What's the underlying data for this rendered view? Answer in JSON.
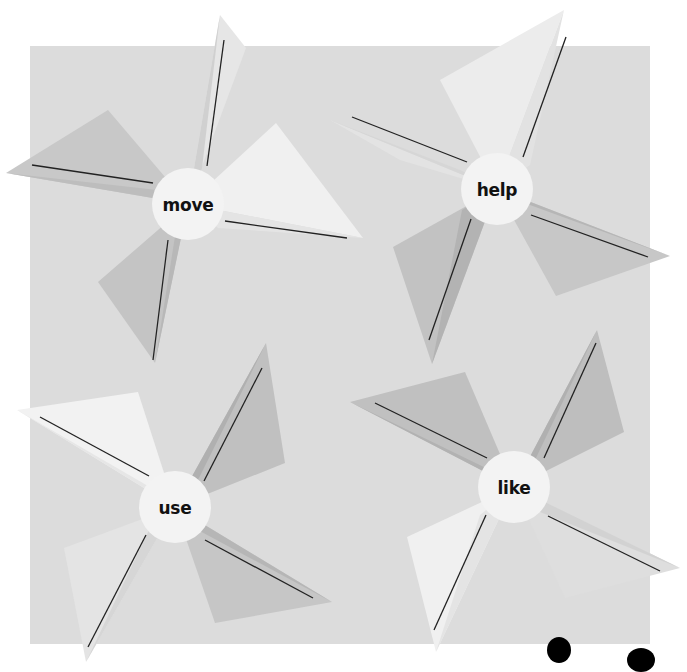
{
  "worksheet": {
    "background_color": "#ffffff",
    "panel_color": "#dcdcdc",
    "pinwheels": [
      {
        "word": "move",
        "center": [
          188,
          204
        ],
        "blades": [
          {
            "tip": [
              220,
              15
            ],
            "line": [
              [
                224,
                40
              ],
              [
                207,
                166
              ]
            ],
            "light": "#e6e6e6",
            "dark": "#d0d0d0",
            "base": [
              [
                246,
                48
              ],
              [
                202,
                168
              ]
            ]
          },
          {
            "tip": [
              6,
              173
            ],
            "line": [
              [
                32,
                165
              ],
              [
                153,
                183
              ]
            ],
            "light": "#c8c8c8",
            "dark": "#bdbdbd",
            "base": [
              [
                108,
                110
              ],
              [
                157,
                190
              ]
            ]
          },
          {
            "tip": [
              155,
              363
            ],
            "line": [
              [
                153,
                360
              ],
              [
                168,
                240
              ]
            ],
            "light": "#c4c4c4",
            "dark": "#b8b8b8",
            "base": [
              [
                98,
                282
              ],
              [
                176,
                230
              ]
            ]
          },
          {
            "tip": [
              363,
              238
            ],
            "line": [
              [
                225,
                221
              ],
              [
                347,
                238
              ]
            ],
            "light": "#f0f0f0",
            "dark": "#e4e4e4",
            "base": [
              [
                276,
                123
              ],
              [
                218,
                228
              ]
            ]
          }
        ]
      },
      {
        "word": "help",
        "center": [
          497,
          189
        ],
        "blades": [
          {
            "tip": [
              564,
              10
            ],
            "line": [
              [
                566,
                37
              ],
              [
                523,
                157
              ]
            ],
            "light": "#ececec",
            "dark": "#e2e2e2",
            "base": [
              [
                440,
                80
              ],
              [
                530,
                165
              ]
            ]
          },
          {
            "tip": [
              330,
              120
            ],
            "line": [
              [
                352,
                117
              ],
              [
                467,
                162
              ]
            ],
            "light": "#e3e3e3",
            "dark": "#d6d6d6",
            "base": [
              [
                400,
                160
              ],
              [
                460,
                170
              ]
            ]
          },
          {
            "tip": [
              432,
              364
            ],
            "line": [
              [
                429,
                340
              ],
              [
                471,
                219
              ]
            ],
            "light": "#c2c2c2",
            "dark": "#b3b3b3",
            "base": [
              [
                393,
                247
              ],
              [
                462,
                210
              ]
            ]
          },
          {
            "tip": [
              670,
              256
            ],
            "line": [
              [
                531,
                215
              ],
              [
                648,
                257
              ]
            ],
            "light": "#c7c7c7",
            "dark": "#b6b6b6",
            "base": [
              [
                556,
                296
              ],
              [
                530,
                205
              ]
            ]
          }
        ]
      },
      {
        "word": "use",
        "center": [
          175,
          507
        ],
        "blades": [
          {
            "tip": [
              266,
              343
            ],
            "line": [
              [
                262,
                368
              ],
              [
                204,
                481
              ]
            ],
            "light": "#c0c0c0",
            "dark": "#b0b0b0",
            "base": [
              [
                285,
                463
              ],
              [
                199,
                478
              ]
            ]
          },
          {
            "tip": [
              17,
              410
            ],
            "line": [
              [
                40,
                417
              ],
              [
                149,
                476
              ]
            ],
            "light": "#f2f2f2",
            "dark": "#e6e6e6",
            "base": [
              [
                138,
                392
              ],
              [
                148,
                486
              ]
            ]
          },
          {
            "tip": [
              86,
              662
            ],
            "line": [
              [
                88,
                647
              ],
              [
                146,
                535
              ]
            ],
            "light": "#e4e4e4",
            "dark": "#d6d6d6",
            "base": [
              [
                64,
                548
              ],
              [
                150,
                528
              ]
            ]
          },
          {
            "tip": [
              332,
              602
            ],
            "line": [
              [
                205,
                540
              ],
              [
                313,
                598
              ]
            ],
            "light": "#c6c6c6",
            "dark": "#b6b6b6",
            "base": [
              [
                215,
                623
              ],
              [
                198,
                530
              ]
            ]
          }
        ]
      },
      {
        "word": "like",
        "center": [
          514,
          487
        ],
        "blades": [
          {
            "tip": [
              597,
              330
            ],
            "line": [
              [
                596,
                343
              ],
              [
                544,
                458
              ]
            ],
            "light": "#bebebe",
            "dark": "#b0b0b0",
            "base": [
              [
                624,
                432
              ],
              [
                535,
                460
              ]
            ]
          },
          {
            "tip": [
              350,
              402
            ],
            "line": [
              [
                375,
                403
              ],
              [
                487,
                458
              ]
            ],
            "light": "#c0c0c0",
            "dark": "#b2b2b2",
            "base": [
              [
                465,
                372
              ],
              [
                490,
                470
              ]
            ]
          },
          {
            "tip": [
              436,
              652
            ],
            "line": [
              [
                434,
                630
              ],
              [
                486,
                515
              ]
            ],
            "light": "#f0f0f0",
            "dark": "#e4e4e4",
            "base": [
              [
                407,
                537
              ],
              [
                480,
                515
              ]
            ]
          },
          {
            "tip": [
              680,
              568
            ],
            "line": [
              [
                548,
                516
              ],
              [
                660,
                571
              ]
            ],
            "light": "#dedede",
            "dark": "#d2d2d2",
            "base": [
              [
                565,
                598
              ],
              [
                540,
                512
              ]
            ]
          }
        ]
      }
    ],
    "partial_marks": [
      {
        "shape": "blob",
        "center": [
          559,
          650
        ],
        "w": 24,
        "h": 26
      },
      {
        "shape": "blob",
        "center": [
          641,
          660
        ],
        "w": 28,
        "h": 24
      }
    ]
  }
}
